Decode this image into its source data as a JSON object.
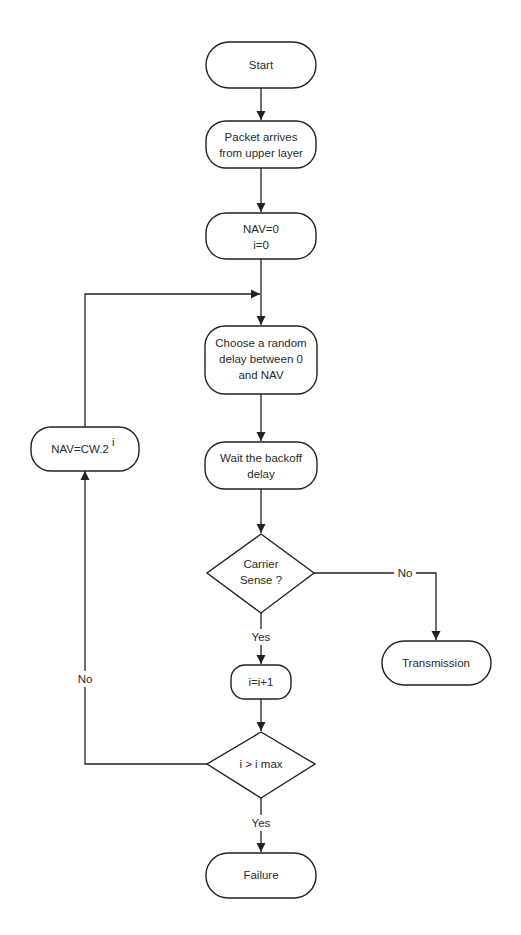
{
  "diagram": {
    "type": "flowchart",
    "colors": {
      "stroke": "#222222",
      "text": "#2a2a2a",
      "background": "#ffffff"
    },
    "nodes": {
      "start": {
        "shape": "terminal",
        "lines": [
          "Start"
        ]
      },
      "packet_arrives": {
        "shape": "process",
        "lines": [
          "Packet arrives",
          "from upper layer"
        ]
      },
      "init": {
        "shape": "process",
        "lines": [
          "NAV=0",
          "i=0"
        ]
      },
      "choose_delay": {
        "shape": "process",
        "lines": [
          "Choose a random",
          "delay between 0",
          "and NAV"
        ]
      },
      "wait_backoff": {
        "shape": "process",
        "lines": [
          "Wait the backoff",
          "delay"
        ]
      },
      "carrier_sense": {
        "shape": "decision",
        "lines": [
          "Carrier",
          "Sense ?"
        ]
      },
      "transmission": {
        "shape": "terminal",
        "lines": [
          "Transmission"
        ]
      },
      "increment": {
        "shape": "process",
        "lines": [
          "i=i+1"
        ]
      },
      "check_max": {
        "shape": "decision",
        "lines": [
          "i > i max"
        ]
      },
      "failure": {
        "shape": "terminal",
        "lines": [
          "Failure"
        ]
      },
      "update_nav": {
        "shape": "process",
        "text": "NAV=CW.2",
        "superscript": "i"
      }
    },
    "edges": {
      "start_to_packet": {
        "from": "start",
        "to": "packet_arrives",
        "label": ""
      },
      "packet_to_init": {
        "from": "packet_arrives",
        "to": "init",
        "label": ""
      },
      "init_to_choose": {
        "from": "init",
        "to": "choose_delay",
        "label": ""
      },
      "choose_to_wait": {
        "from": "choose_delay",
        "to": "wait_backoff",
        "label": ""
      },
      "wait_to_carrier": {
        "from": "wait_backoff",
        "to": "carrier_sense",
        "label": ""
      },
      "carrier_no": {
        "from": "carrier_sense",
        "to": "transmission",
        "label": "No"
      },
      "carrier_yes": {
        "from": "carrier_sense",
        "to": "increment",
        "label": "Yes"
      },
      "increment_to_check": {
        "from": "increment",
        "to": "check_max",
        "label": ""
      },
      "check_yes": {
        "from": "check_max",
        "to": "failure",
        "label": "Yes"
      },
      "check_no": {
        "from": "check_max",
        "to": "update_nav",
        "label": "No"
      },
      "update_loop": {
        "from": "update_nav",
        "to": "choose_delay",
        "label": ""
      }
    }
  }
}
